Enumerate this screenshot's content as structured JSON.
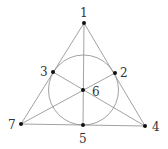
{
  "diagram": {
    "type": "fano-plane",
    "points": [
      {
        "id": "1",
        "label": "1",
        "x": 84,
        "y": 23,
        "lx": 80,
        "ly": 17
      },
      {
        "id": "2",
        "label": "2",
        "x": 115,
        "y": 73,
        "lx": 120,
        "ly": 77
      },
      {
        "id": "3",
        "label": "3",
        "x": 53,
        "y": 72,
        "lx": 40,
        "ly": 76
      },
      {
        "id": "4",
        "label": "4",
        "x": 145,
        "y": 126,
        "lx": 152,
        "ly": 131
      },
      {
        "id": "5",
        "label": "5",
        "x": 83,
        "y": 125,
        "lx": 79,
        "ly": 143
      },
      {
        "id": "6",
        "label": "6",
        "x": 83,
        "y": 90,
        "lx": 92,
        "ly": 96
      },
      {
        "id": "7",
        "label": "7",
        "x": 21,
        "y": 124,
        "lx": 8,
        "ly": 129
      }
    ],
    "lines": [
      [
        "1",
        "3",
        "7"
      ],
      [
        "1",
        "2",
        "4"
      ],
      [
        "7",
        "5",
        "4"
      ],
      [
        "1",
        "6",
        "5"
      ],
      [
        "7",
        "6",
        "2"
      ],
      [
        "3",
        "6",
        "4"
      ]
    ],
    "circle": {
      "through": [
        "3",
        "2",
        "5"
      ],
      "cx": 83.5,
      "cy": 90,
      "r": 35
    },
    "colors": {
      "line": "#8a8a8a",
      "point": "#111111",
      "label": "#333333"
    }
  }
}
